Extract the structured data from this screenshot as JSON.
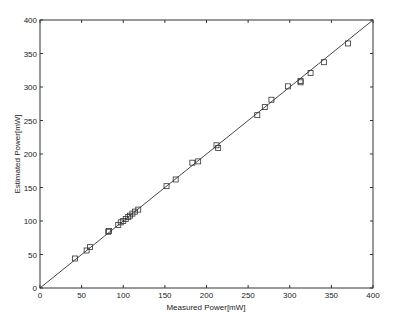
{
  "chart_data": {
    "type": "scatter",
    "title": "",
    "xlabel": "Measured Power[mW]",
    "ylabel": "Estimated Power[mW]",
    "xlim": [
      0,
      400
    ],
    "ylim": [
      0,
      400
    ],
    "grid": false,
    "legend": null,
    "x_ticks": [
      0,
      50,
      100,
      150,
      200,
      250,
      300,
      350,
      400
    ],
    "y_ticks": [
      0,
      50,
      100,
      150,
      200,
      250,
      300,
      350,
      400
    ],
    "reference_line": {
      "name": "y = x",
      "from": [
        0,
        0
      ],
      "to": [
        400,
        400
      ]
    },
    "series": [
      {
        "name": "measurements",
        "marker": "square",
        "points": [
          [
            42,
            44
          ],
          [
            56,
            56
          ],
          [
            60,
            61
          ],
          [
            82,
            84
          ],
          [
            83,
            85
          ],
          [
            94,
            94
          ],
          [
            97,
            98
          ],
          [
            100,
            100
          ],
          [
            103,
            103
          ],
          [
            106,
            106
          ],
          [
            108,
            108
          ],
          [
            111,
            111
          ],
          [
            114,
            114
          ],
          [
            118,
            117
          ],
          [
            152,
            152
          ],
          [
            163,
            162
          ],
          [
            183,
            187
          ],
          [
            190,
            189
          ],
          [
            212,
            213
          ],
          [
            214,
            209
          ],
          [
            261,
            258
          ],
          [
            270,
            270
          ],
          [
            278,
            281
          ],
          [
            298,
            301
          ],
          [
            313,
            309
          ],
          [
            313,
            307
          ],
          [
            325,
            321
          ],
          [
            341,
            337
          ],
          [
            370,
            365
          ]
        ]
      }
    ]
  }
}
